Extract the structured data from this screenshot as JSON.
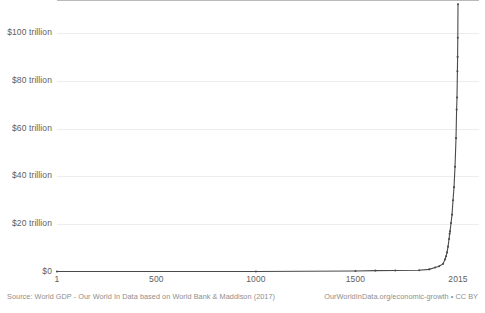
{
  "chart_data": {
    "type": "line",
    "title": "",
    "subtitle": "",
    "xlabel": "",
    "ylabel": "",
    "xlim": [
      1,
      2015
    ],
    "ylim": [
      0,
      113
    ],
    "grid": true,
    "legend": "none",
    "y_unit": "trillion US$",
    "y_ticks": [
      {
        "value": 0,
        "label": "$0"
      },
      {
        "value": 20,
        "label": "$20 trillion"
      },
      {
        "value": 40,
        "label": "$40 trillion"
      },
      {
        "value": 60,
        "label": "$60 trillion"
      },
      {
        "value": 80,
        "label": "$80 trillion"
      },
      {
        "value": 100,
        "label": "$100 trillion"
      }
    ],
    "x_ticks": [
      {
        "value": 1,
        "label": "1"
      },
      {
        "value": 500,
        "label": "500"
      },
      {
        "value": 1000,
        "label": "1000"
      },
      {
        "value": 1500,
        "label": "1500"
      },
      {
        "value": 2015,
        "label": "2015"
      }
    ],
    "series": [
      {
        "name": "World GDP",
        "color": "#4a4a4a",
        "x": [
          1,
          1000,
          1500,
          1600,
          1700,
          1820,
          1870,
          1900,
          1920,
          1940,
          1950,
          1955,
          1960,
          1965,
          1970,
          1973,
          1975,
          1980,
          1985,
          1990,
          1995,
          2000,
          2005,
          2008,
          2010,
          2012,
          2013,
          2014,
          2015
        ],
        "y": [
          0.18,
          0.21,
          0.43,
          0.58,
          0.64,
          0.74,
          1.1,
          1.9,
          2.4,
          3.4,
          5.3,
          6.6,
          8.2,
          10.6,
          13.8,
          16.0,
          17.0,
          20.5,
          24.0,
          30.0,
          35.5,
          44.0,
          56.0,
          68.0,
          73.0,
          84.0,
          90.0,
          98.0,
          112.0
        ]
      }
    ],
    "source_note": "Source: World GDP - Our World In Data based on World Bank & Maddison (2017)",
    "credit_note": "OurWorldInData.org/economic-growth • CC BY"
  },
  "footer": {
    "source": "Source: World GDP - Our World In Data based on World Bank & Maddison (2017)",
    "credit": "OurWorldInData.org/economic-growth • CC BY"
  },
  "colors": {
    "line": "#4a4a4a",
    "grid": "#ededed",
    "axis": "#b9b9b9",
    "text": "#5e5e5e",
    "footer_text": "#8e8e8e",
    "background": "#ffffff"
  }
}
